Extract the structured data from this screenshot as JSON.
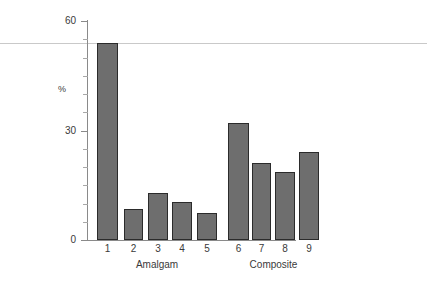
{
  "chart_data": {
    "type": "bar",
    "title": "",
    "subtitle": "",
    "xlabel": "",
    "ylabel": "%",
    "categories": [
      "1",
      "2",
      "3",
      "4",
      "5",
      "6",
      "7",
      "8",
      "9"
    ],
    "values": [
      54,
      8.5,
      13,
      10.5,
      7.5,
      32,
      21,
      18.5,
      24
    ],
    "series": [
      {
        "name": "",
        "values": [
          54,
          8.5,
          13,
          10.5,
          7.5,
          32,
          21,
          18.5,
          24
        ]
      }
    ],
    "groups": [
      {
        "label": "Amalgam",
        "categories": [
          "1",
          "2",
          "3",
          "4",
          "5"
        ]
      },
      {
        "label": "Composite",
        "categories": [
          "6",
          "7",
          "8",
          "9"
        ]
      }
    ],
    "ylim": [
      0,
      60
    ],
    "y_major_ticks": [
      0,
      30,
      60
    ],
    "y_major_tick_labels": [
      "0",
      "30",
      "60"
    ],
    "y_minor_tick_interval": 5,
    "grid": false,
    "legend": "none",
    "annotations": [
      {
        "type": "horizontal-rule",
        "value": 52.5,
        "full_width": true
      }
    ],
    "colors": {
      "bar_fill": "#6e6e6e",
      "bar_edge": "#2b2b2b",
      "axis": "#8a8a8a",
      "rule": "#c9c9c9",
      "text": "#3a3a3a",
      "background": "#ffffff"
    }
  },
  "axes": {
    "y_title": "%",
    "y_ticks": [
      {
        "label": "60",
        "value": 60
      },
      {
        "label": "30",
        "value": 30
      },
      {
        "label": "0",
        "value": 0
      }
    ]
  },
  "bars": [
    {
      "label": "1",
      "value": 54,
      "group": "Amalgam"
    },
    {
      "label": "2",
      "value": 8.5,
      "group": "Amalgam"
    },
    {
      "label": "3",
      "value": 13,
      "group": "Amalgam"
    },
    {
      "label": "4",
      "value": 10.5,
      "group": "Amalgam"
    },
    {
      "label": "5",
      "value": 7.5,
      "group": "Amalgam"
    },
    {
      "label": "6",
      "value": 32,
      "group": "Composite"
    },
    {
      "label": "7",
      "value": 21,
      "group": "Composite"
    },
    {
      "label": "8",
      "value": 18.5,
      "group": "Composite"
    },
    {
      "label": "9",
      "value": 24,
      "group": "Composite"
    }
  ],
  "group_labels": [
    {
      "label": "Amalgam"
    },
    {
      "label": "Composite"
    }
  ],
  "footer": {
    "artifact_text": ""
  }
}
